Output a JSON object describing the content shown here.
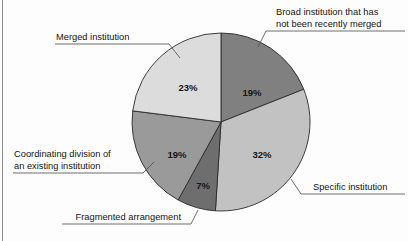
{
  "chart_data": {
    "type": "pie",
    "title": "",
    "subtitle": "",
    "xlabel": "",
    "ylabel": "",
    "legend_position": "callout-labels",
    "grid": false,
    "start_angle_deg": 0,
    "direction": "clockwise",
    "units": "percent",
    "categories": [
      "Broad institution that has not been recently merged",
      "Specific institution",
      "Fragmented arrangement",
      "Coordinating division of an existing institution",
      "Merged institution"
    ],
    "values": [
      19,
      32,
      7,
      19,
      23
    ],
    "value_labels": [
      "19%",
      "32%",
      "7%",
      "19%",
      "23%"
    ],
    "slices": [
      {
        "id": "broad-institution",
        "label_lines": [
          "Broad institution that has",
          "not been recently merged"
        ],
        "value": 19,
        "value_label": "19%",
        "color": "#808080",
        "label_x": 252,
        "label_y": 93,
        "callout_anchor": "start",
        "callout_x": 276,
        "callout_y_first": 15,
        "callout_y_second": 27,
        "underline": "M 276 31 L 404 31",
        "leader": "M 276 31 L 266 31 L 258 47"
      },
      {
        "id": "specific-institution",
        "label": "Specific institution",
        "value": 32,
        "value_label": "32%",
        "color": "#c2c2c2",
        "label_x": 262,
        "label_y": 155,
        "callout_anchor": "start",
        "callout_x": 312,
        "callout_y_first": 189,
        "underline": "M 312 194 L 404 194",
        "leader": "M 312 194 L 302 194 L 292 178"
      },
      {
        "id": "fragmented-arrangement",
        "label": "Fragmented arrangement",
        "value": 7,
        "value_label": "7%",
        "color": "#6e6e6e",
        "label_x": 203,
        "label_y": 186,
        "callout_anchor": "end",
        "callout_x": 182,
        "callout_y_first": 219,
        "underline": "M 62 224 L 182 224",
        "leader": "M 182 224 L 190 224 L 197 211"
      },
      {
        "id": "coordinating-division",
        "label_lines": [
          "Coordinating division of",
          "an existing institution"
        ],
        "value": 19,
        "value_label": "19%",
        "color": "#9a9a9a",
        "label_x": 177,
        "label_y": 155,
        "callout_anchor": "end",
        "callout_x": 133,
        "callout_y_first": 156,
        "callout_y_second": 168,
        "underline": "M 14 173 L 133 173",
        "leader": "M 133 173 L 142 173 L 152 161"
      },
      {
        "id": "merged-institution",
        "label": "Merged institution",
        "value": 23,
        "value_label": "23%",
        "color": "#dcdcdc",
        "label_x": 188,
        "label_y": 88,
        "callout_anchor": "start",
        "callout_x": 57,
        "callout_y_first": 38,
        "underline": "M 55 44 L 158 44",
        "leader": "M 158 44 L 168 44 L 178 58"
      }
    ],
    "geometry": {
      "center_x": 221,
      "center_y": 122,
      "radius": 89
    },
    "colors": {
      "slice_1": "#808080",
      "slice_2": "#c2c2c2",
      "slice_3": "#6e6e6e",
      "slice_4": "#9a9a9a",
      "slice_5": "#dcdcdc",
      "outline": "#2b2b2b",
      "leader_line": "#4a4a4a",
      "text": "#141414",
      "background": "#fdfdfd"
    }
  }
}
